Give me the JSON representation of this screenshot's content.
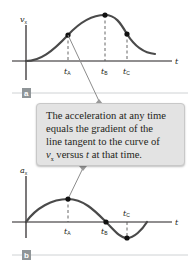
{
  "panels": [
    {
      "id": "a",
      "badge": "a",
      "y_axis_label": "v",
      "y_axis_sub": "x",
      "x_axis_label": "t",
      "markers": [
        {
          "label": "t",
          "sub": "A"
        },
        {
          "label": "t",
          "sub": "B"
        },
        {
          "label": "t",
          "sub": "C"
        }
      ]
    },
    {
      "id": "b",
      "badge": "b",
      "y_axis_label": "a",
      "y_axis_sub": "x",
      "x_axis_label": "t",
      "markers": [
        {
          "label": "t",
          "sub": "A"
        },
        {
          "label": "t",
          "sub": "B"
        },
        {
          "label": "t",
          "sub": "C"
        }
      ]
    }
  ],
  "callout": {
    "line1": "The acceleration at any time",
    "line2": "equals the gradient of the",
    "line3": "line tangent to the curve of",
    "line4_var": "v",
    "line4_sub": "x",
    "line4_mid": " versus ",
    "line4_t": "t",
    "line4_end": " at that time."
  },
  "colors": {
    "curve": "#4a4a4a",
    "callout_bg": "#e3e3e3",
    "badge": "#8f9598",
    "divider": "#cfd2d4"
  }
}
